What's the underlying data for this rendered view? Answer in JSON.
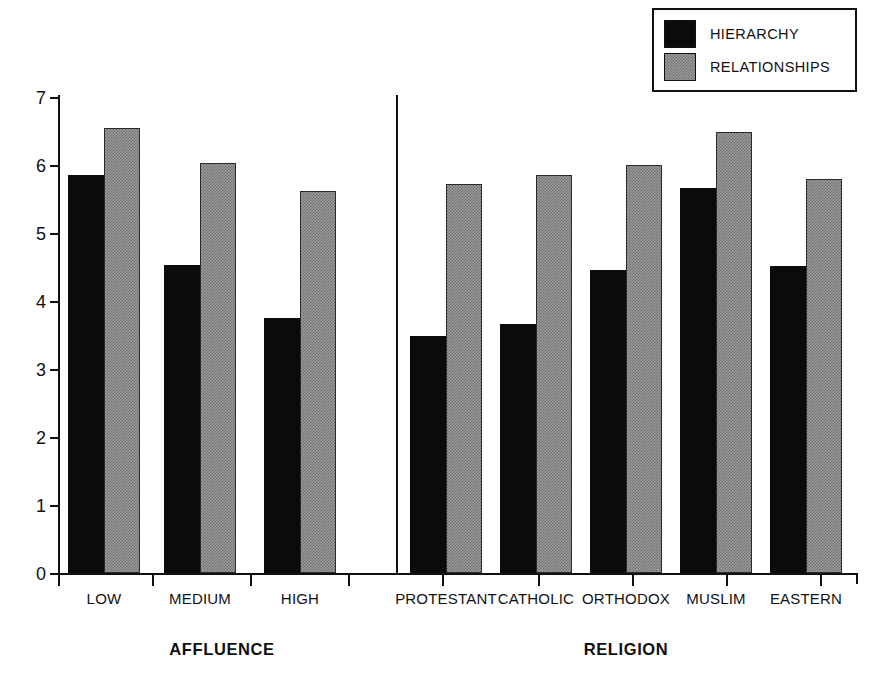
{
  "legend": {
    "position": "top-right",
    "entries": [
      {
        "label": "HIERARCHY",
        "swatch": "black-square-swatch",
        "color": "#0b0b0b"
      },
      {
        "label": "RELATIONSHIPS",
        "swatch": "gray-stipple-square-swatch",
        "color": "#9d9d9d"
      }
    ]
  },
  "axis": {
    "y_ticks": [
      "0",
      "1",
      "2",
      "3",
      "4",
      "5",
      "6",
      "7"
    ]
  },
  "groups": [
    {
      "label": "AFFLUENCE",
      "categories": [
        "LOW",
        "MEDIUM",
        "HIGH"
      ]
    },
    {
      "label": "RELIGION",
      "categories": [
        "PROTESTANT",
        "CATHOLIC",
        "ORTHODOX",
        "MUSLIM",
        "EASTERN"
      ]
    }
  ],
  "chart_data": {
    "type": "bar",
    "title": "",
    "subtitle": "",
    "xlabel": "",
    "ylabel": "",
    "ylim": [
      0,
      7
    ],
    "ytick_step": 1,
    "grid": false,
    "legend_position": "top-right",
    "grouped": true,
    "group_separator_after": "HIGH",
    "categories": [
      "LOW",
      "MEDIUM",
      "HIGH",
      "PROTESTANT",
      "CATHOLIC",
      "ORTHODOX",
      "MUSLIM",
      "EASTERN"
    ],
    "category_groups": [
      "AFFLUENCE",
      "AFFLUENCE",
      "AFFLUENCE",
      "RELIGION",
      "RELIGION",
      "RELIGION",
      "RELIGION",
      "RELIGION"
    ],
    "series": [
      {
        "name": "HIERARCHY",
        "color": "#0b0b0b",
        "fill": "solid-black",
        "values": [
          5.85,
          4.53,
          3.75,
          3.49,
          3.66,
          4.46,
          5.66,
          4.51
        ]
      },
      {
        "name": "RELATIONSHIPS",
        "color": "#9d9d9d",
        "fill": "gray-stipple",
        "values": [
          6.54,
          6.03,
          5.62,
          5.72,
          5.85,
          6.0,
          6.48,
          5.79
        ]
      }
    ]
  },
  "layout": {
    "baseline_y": 573,
    "top_y": 97,
    "px_per_unit": 68,
    "axis_left_x": 58,
    "axis_right_x": 858,
    "divider_x": 397,
    "bar_width": 36,
    "pair_starts": [
      68,
      164,
      264,
      410,
      500,
      590,
      680,
      770
    ],
    "xtick_x": [
      58,
      152,
      250,
      348,
      442,
      538,
      632,
      726,
      820,
      856
    ],
    "cat_centers": [
      104,
      200,
      300,
      446,
      536,
      626,
      716,
      806
    ],
    "group_centers": [
      222,
      626
    ]
  }
}
